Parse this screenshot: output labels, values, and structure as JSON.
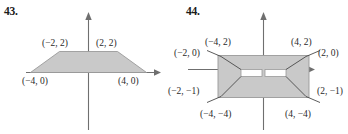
{
  "page": {
    "background_color": "#ffffff",
    "text_color": "#2a2a2a",
    "figure_fill_color": "#c9c9c9",
    "figure_stroke_color": "#8f8f8f",
    "axis_color": "#6f6f6f",
    "slot_fill_color": "#ffffff"
  },
  "figures": [
    {
      "number": "43.",
      "shape": "trapezoid",
      "vertices": [
        {
          "label": "(−4, 0)",
          "x": -4,
          "y": 0
        },
        {
          "label": "(−2, 2)",
          "x": -2,
          "y": 2
        },
        {
          "label": "(2, 2)",
          "x": 2,
          "y": 2
        },
        {
          "label": "(4, 0)",
          "x": 4,
          "y": 0
        }
      ],
      "labels": {
        "top_left": "(−2, 2)",
        "top_right": "(2, 2)",
        "bottom_left": "(−4, 0)",
        "bottom_right": "(4, 0)"
      },
      "axes": {
        "x_axis": true,
        "y_axis": true,
        "arrowheads": true
      }
    },
    {
      "number": "44.",
      "shape": "rectangle-with-slot",
      "vertices": [
        {
          "label": "(−4, 2)",
          "x": -4,
          "y": 2
        },
        {
          "label": "(4, 2)",
          "x": 4,
          "y": 2
        },
        {
          "label": "(−4, −4)",
          "x": -4,
          "y": -4
        },
        {
          "label": "(4, −4)",
          "x": 4,
          "y": -4
        }
      ],
      "slot_vertices": [
        {
          "label": "(−2, 0)",
          "x": -2,
          "y": 0
        },
        {
          "label": "(2, 0)",
          "x": 2,
          "y": 0
        },
        {
          "label": "(−2, −1)",
          "x": -2,
          "y": -1
        },
        {
          "label": "(2, −1)",
          "x": 2,
          "y": -1
        }
      ],
      "labels": {
        "top_left": "(−4, 2)",
        "top_right": "(4, 2)",
        "bottom_left": "(−4, −4)",
        "bottom_right": "(4, −4)",
        "slot_top_left": "(−2, 0)",
        "slot_top_right": "(2, 0)",
        "slot_bottom_left": "(−2, −1)",
        "slot_bottom_right": "(2, −1)"
      },
      "axes": {
        "x_axis": true,
        "y_axis": true,
        "arrowheads": true
      }
    }
  ]
}
